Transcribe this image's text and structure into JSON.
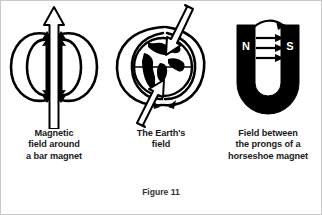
{
  "figure": {
    "caption": "Figure 11",
    "background_color": "#ffffff",
    "ink_color": "#000000",
    "border_color": "#c8c8c8"
  },
  "panels": [
    {
      "id": "bar-magnet",
      "caption_lines": [
        "Magnetic",
        "field around",
        "a bar magnet"
      ],
      "magnet": {
        "shape": "bar",
        "fill_color": "#000000",
        "pole_top_label": "N",
        "pole_bottom_label": "S",
        "pole_label_color": "#ffffff"
      },
      "field_lines": {
        "count": 4,
        "description": "closed loops from N pole around to S pole",
        "arrow_direction": "N-to-S-around-outside"
      },
      "axis_arrow": {
        "style": "hollow-outline",
        "direction": "up",
        "description": "large open arrow passing vertically through the magnet"
      }
    },
    {
      "id": "earth-field",
      "caption_lines": [
        "The Earth's",
        "field"
      ],
      "magnet": {
        "shape": "globe",
        "fill_color": "#000000",
        "description": "Earth with continents, equator line"
      },
      "field_lines": {
        "count": 3,
        "description": "oval magnetic field loops around the globe",
        "arrow_direction": "south-to-north"
      },
      "axis_arrow": {
        "style": "hollow-outline",
        "direction": "down-left-tilted",
        "description": "tilted magnetic axis arrow through the globe"
      }
    },
    {
      "id": "horseshoe-magnet",
      "caption_lines": [
        "Field between",
        "the prongs of a",
        "horseshoe magnet"
      ],
      "magnet": {
        "shape": "horseshoe",
        "fill_color": "#000000",
        "pole_left_label": "N",
        "pole_right_label": "S",
        "pole_label_color": "#ffffff"
      },
      "field_lines": {
        "count": 5,
        "straight_count": 4,
        "curved_count": 1,
        "description": "straight arrows across the gap from N to S plus one arc over the top",
        "arrow_direction": "N-to-S"
      }
    }
  ]
}
